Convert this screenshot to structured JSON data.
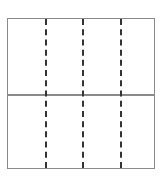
{
  "diagram": {
    "type": "grid-layout",
    "rows": 2,
    "columns": 4,
    "border_color": "#8a8a8a",
    "row_divider_style": "solid",
    "column_divider_style": "dashed",
    "column_divider_color": "#333333",
    "column_divider_positions_px": [
      37,
      74,
      112
    ],
    "row_divider_position_px": 75
  }
}
